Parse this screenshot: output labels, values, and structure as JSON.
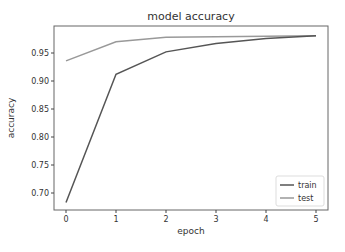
{
  "chart_data": {
    "type": "line",
    "title": "model accuracy",
    "xlabel": "epoch",
    "ylabel": "accuracy",
    "x": [
      0,
      1,
      2,
      3,
      4,
      5
    ],
    "series": [
      {
        "name": "train",
        "color": "#555555",
        "values": [
          0.683,
          0.912,
          0.952,
          0.967,
          0.976,
          0.981
        ]
      },
      {
        "name": "test",
        "color": "#999999",
        "values": [
          0.936,
          0.97,
          0.978,
          0.979,
          0.98,
          0.981
        ]
      }
    ],
    "xticks": [
      "0",
      "1",
      "2",
      "3",
      "4",
      "5"
    ],
    "yticks": [
      "0.70",
      "0.75",
      "0.80",
      "0.85",
      "0.90",
      "0.95"
    ],
    "ytick_values": [
      0.7,
      0.75,
      0.8,
      0.85,
      0.9,
      0.95
    ],
    "xlim": [
      -0.25,
      5.25
    ],
    "ylim": [
      0.668,
      0.996
    ],
    "grid": false,
    "legend_position": "lower right"
  }
}
